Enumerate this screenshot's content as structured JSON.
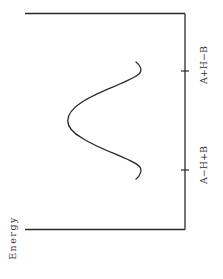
{
  "diagram": {
    "type": "energy-profile",
    "orientation": "rotated-90-ccw",
    "axis_label": "Energy",
    "reaction_coordinate_labels": [
      {
        "label": "A−H+B",
        "position": "reactant"
      },
      {
        "label": "A+H−B",
        "position": "product"
      }
    ],
    "curve": {
      "shape": "single-barrier",
      "description": "Symmetric energy barrier between reactants and products"
    },
    "colors": {
      "line": "#2a2a2a",
      "text": "#333333",
      "background": "#ffffff"
    }
  }
}
